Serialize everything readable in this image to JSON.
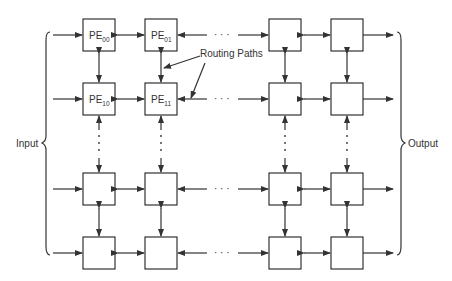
{
  "diagram": {
    "type": "mesh-array",
    "labels": {
      "input": "Input",
      "output": "Output",
      "routing": "Routing Paths"
    },
    "pe_labels": [
      {
        "id": "pe00",
        "base": "PE",
        "sub": "00"
      },
      {
        "id": "pe01",
        "base": "PE",
        "sub": "01"
      },
      {
        "id": "pe10",
        "base": "PE",
        "sub": "10"
      },
      {
        "id": "pe11",
        "base": "PE",
        "sub": "11"
      }
    ],
    "ellipsis": "· · ·",
    "colors": {
      "stroke": "#333333",
      "background": "#ffffff"
    }
  }
}
